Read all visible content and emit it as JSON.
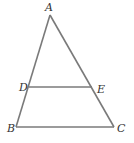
{
  "diagram": {
    "type": "geometry-triangle",
    "line_color": "#7a7a7a",
    "label_color": "#333333",
    "points": {
      "A": {
        "label": "A",
        "x": 50,
        "y": 15
      },
      "B": {
        "label": "B",
        "x": 16,
        "y": 127
      },
      "C": {
        "label": "C",
        "x": 114,
        "y": 127
      },
      "D": {
        "label": "D",
        "x": 29,
        "y": 87
      },
      "E": {
        "label": "E",
        "x": 92,
        "y": 87
      }
    },
    "segments": [
      "AB",
      "AC",
      "BC",
      "DE"
    ]
  }
}
